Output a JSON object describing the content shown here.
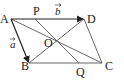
{
  "diagram": {
    "type": "geometry",
    "points": {
      "A": {
        "label": "A",
        "x": 11,
        "y": 19
      },
      "B": {
        "label": "B",
        "x": 29,
        "y": 63
      },
      "C": {
        "label": "C",
        "x": 102,
        "y": 63
      },
      "D": {
        "label": "D",
        "x": 84,
        "y": 19
      },
      "O": {
        "label": "O",
        "x": 56,
        "y": 41
      },
      "P": {
        "label": "P",
        "x": 35,
        "y": 19
      },
      "Q": {
        "label": "Q",
        "x": 79,
        "y": 63
      }
    },
    "vectors": {
      "a": {
        "label": "a",
        "from": "A",
        "to": "B"
      },
      "b": {
        "label": "b",
        "from": "A",
        "to": "D"
      }
    },
    "segments": [
      "AD",
      "DC",
      "CB",
      "BA",
      "AC",
      "BD",
      "PQ"
    ],
    "colors": {
      "line": "#555555",
      "vector": "#222222",
      "text": "#222222"
    }
  }
}
